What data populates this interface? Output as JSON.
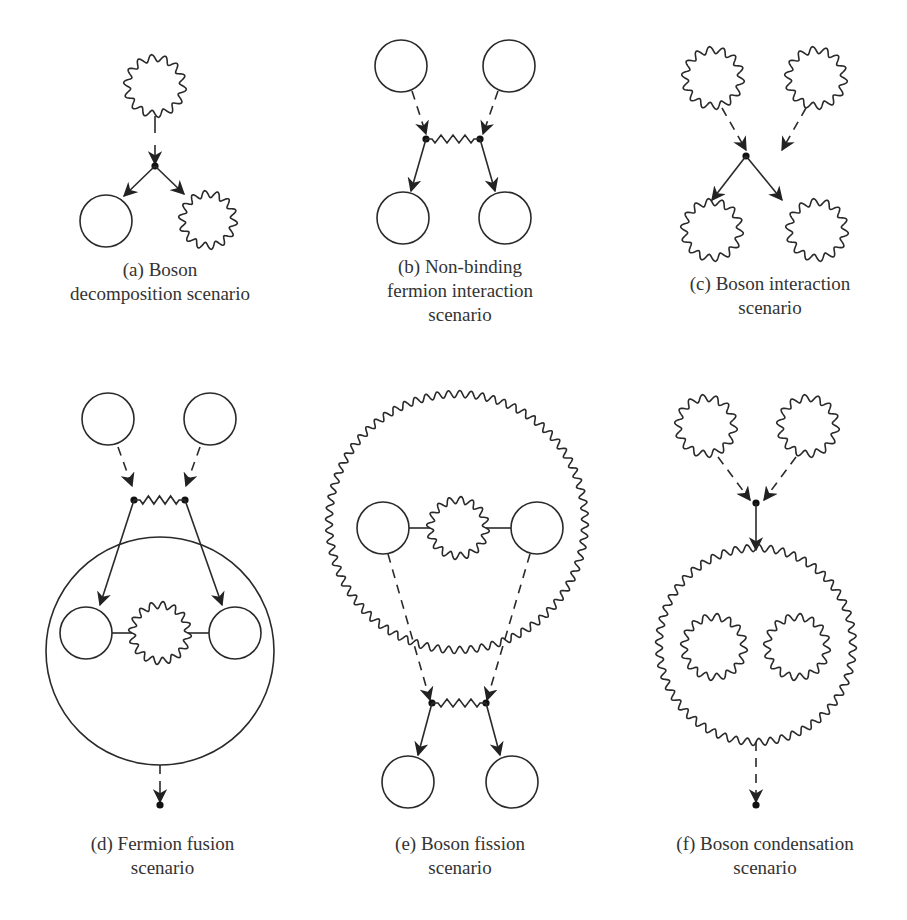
{
  "figure": {
    "panels": [
      {
        "id": "a",
        "caption_lines": [
          "(a) Boson",
          "decomposition scenario"
        ]
      },
      {
        "id": "b",
        "caption_lines": [
          "(b) Non-binding",
          "fermion interaction",
          "scenario"
        ]
      },
      {
        "id": "c",
        "caption_lines": [
          "(c) Boson interaction",
          "scenario"
        ]
      },
      {
        "id": "d",
        "caption_lines": [
          "(d) Fermion fusion",
          "scenario"
        ]
      },
      {
        "id": "e",
        "caption_lines": [
          "(e) Boson fission",
          "scenario"
        ]
      },
      {
        "id": "f",
        "caption_lines": [
          "(f) Boson condensation",
          "scenario"
        ]
      }
    ],
    "legend_semantics": {
      "plain-circle": "fermion",
      "wavy-circle": "boson",
      "dashed-arrow": "incoming",
      "solid-arrow": "outgoing",
      "zigzag-line": "interaction",
      "dot": "vertex"
    }
  }
}
